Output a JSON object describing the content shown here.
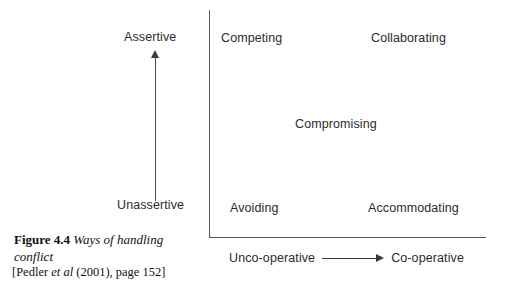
{
  "figure": {
    "number": "Figure 4.4",
    "title": "Ways of handling conflict",
    "citation_open": "[Pedler ",
    "citation_italic": "et al",
    "citation_rest": " (2001), page 152]"
  },
  "chart_data": {
    "type": "table",
    "title": "Ways of handling conflict",
    "xlabel": "Co-operativeness",
    "ylabel": "Assertiveness",
    "grid": false,
    "legend": "none",
    "y_axis": {
      "high_label": "Assertive",
      "low_label": "Unassertive",
      "direction": "arrow points up toward Assertive"
    },
    "x_axis": {
      "low_label": "Unco-operative",
      "high_label": "Co-operative",
      "direction": "arrow points right toward Co-operative"
    },
    "categories": [
      "Unco-operative",
      "Co-operative"
    ],
    "rows": [
      "Assertive",
      "Middle",
      "Unassertive"
    ],
    "cells": [
      {
        "label": "Competing",
        "assertiveness": "Assertive",
        "cooperativeness": "Unco-operative"
      },
      {
        "label": "Collaborating",
        "assertiveness": "Assertive",
        "cooperativeness": "Co-operative"
      },
      {
        "label": "Compromising",
        "assertiveness": "Middle",
        "cooperativeness": "Middle"
      },
      {
        "label": "Avoiding",
        "assertiveness": "Unassertive",
        "cooperativeness": "Unco-operative"
      },
      {
        "label": "Accommodating",
        "assertiveness": "Unassertive",
        "cooperativeness": "Co-operative"
      }
    ]
  },
  "colors": {
    "background": "#ffffff",
    "text": "#2b2b2b",
    "axis_line": "#5a5a5a",
    "arrow": "#3a3a3a",
    "caption_text": "#111111"
  }
}
